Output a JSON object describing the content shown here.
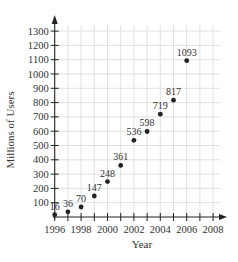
{
  "chart_data": {
    "type": "scatter",
    "title": "",
    "xlabel": "Year",
    "ylabel": "Millions of Users",
    "x": [
      1996,
      1997,
      1998,
      1999,
      2000,
      2001,
      2002,
      2003,
      2004,
      2005,
      2006
    ],
    "y": [
      16,
      36,
      70,
      147,
      248,
      361,
      536,
      598,
      719,
      817,
      1093
    ],
    "point_labels": [
      "16",
      "36",
      "70",
      "147",
      "248",
      "361",
      "536",
      "598",
      "719",
      "817",
      "1093"
    ],
    "xlim": [
      1996,
      2008
    ],
    "ylim": [
      0,
      1300
    ],
    "x_ticks": [
      1996,
      1998,
      2000,
      2002,
      2004,
      2006,
      2008
    ],
    "y_ticks": [
      100,
      200,
      300,
      400,
      500,
      600,
      700,
      800,
      900,
      1000,
      1100,
      1200,
      1300
    ],
    "grid": true,
    "legend": null
  }
}
